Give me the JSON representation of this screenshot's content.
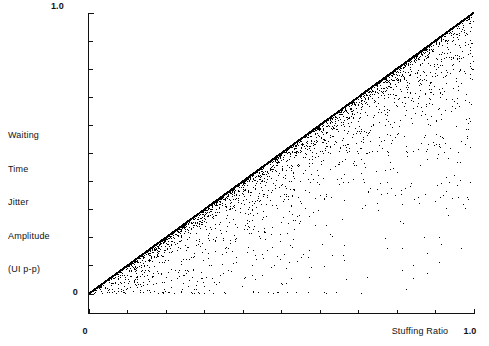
{
  "chart_data": {
    "type": "scatter",
    "title": "",
    "subtitle": "",
    "xlabel": "Stuffing Ratio",
    "ylabel": "Waiting Time Jitter Amplitude (UI p-p)",
    "ylabel_lines": [
      "Waiting",
      "Time",
      "Jitter",
      "Amplitude",
      "(UI p-p)"
    ],
    "xlim": [
      0,
      1
    ],
    "ylim": [
      0,
      1
    ],
    "x_tick_labels": [
      "0",
      "1.0"
    ],
    "y_tick_labels": [
      "0",
      "1.0"
    ],
    "x_tick_values": [
      0,
      1.0
    ],
    "y_tick_values": [
      0,
      1.0
    ],
    "x_minor_tick_count": 10,
    "y_minor_tick_count": 10,
    "grid": false,
    "legend": "none",
    "marker": "dot",
    "marker_color": "#000000",
    "axis_color": "#111111",
    "background_color": "#ffffff",
    "envelope": {
      "slope": 1.0,
      "intercept": 0.0
    },
    "fan_origins": [
      0.5,
      0.3333,
      0.6667,
      0.25,
      0.75,
      0.2,
      0.4,
      0.6,
      0.8,
      0.1667,
      0.8333,
      0.1429,
      0.2857,
      0.4286,
      0.5714,
      0.7143,
      0.8571,
      0.125,
      0.375,
      0.625,
      0.875
    ],
    "baseline_points_y": 0.0,
    "point_count_estimate": 6000,
    "series": [
      {
        "name": "waiting time jitter",
        "x": [
          0.0,
          0.05,
          0.1,
          0.15,
          0.2,
          0.25,
          0.3,
          0.3333,
          0.4,
          0.45,
          0.5,
          0.55,
          0.6,
          0.6667,
          0.7,
          0.75,
          0.8,
          0.85,
          0.9,
          0.95,
          1.0
        ],
        "y": [
          0.0,
          0.05,
          0.1,
          0.15,
          0.2,
          0.25,
          0.3,
          0.3333,
          0.4,
          0.45,
          0.5,
          0.55,
          0.6,
          0.6667,
          0.7,
          0.75,
          0.8,
          0.85,
          0.9,
          0.95,
          1.0
        ]
      }
    ]
  },
  "axes": {
    "y_top_label": "1.0",
    "y_zero_label": "0",
    "x_zero_label": "0",
    "x_max_label": "1.0",
    "x_axis_title": "Stuffing Ratio",
    "y_axis_title_lines": [
      "Waiting",
      "Time",
      "Jitter",
      "Amplitude",
      "(UI p-p)"
    ]
  }
}
